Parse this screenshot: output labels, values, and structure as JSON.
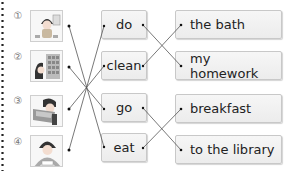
{
  "exercise": {
    "rows": [
      {
        "number": "①",
        "picture": "person-bathing-icon"
      },
      {
        "number": "②",
        "picture": "person-at-library-icon"
      },
      {
        "number": "③",
        "picture": "person-doing-homework-icon"
      },
      {
        "number": "④",
        "picture": "person-eating-breakfast-icon"
      }
    ],
    "verbs": [
      "do",
      "clean",
      "go",
      "eat"
    ],
    "phrases": [
      "the bath",
      "my homework",
      "breakfast",
      "to the library"
    ]
  },
  "colors": {
    "line": "#555555",
    "dot": "#111111",
    "box_border": "#c8c8c8",
    "box_bg": "#f0f0f0"
  }
}
